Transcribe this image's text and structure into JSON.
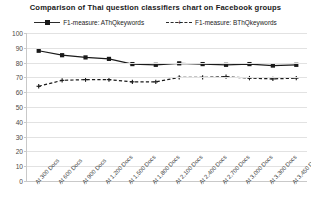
{
  "chart_data": {
    "type": "line",
    "title": "Comparison of Thai question classifiers  chart on Facebook groups",
    "xlabel": "",
    "ylabel": "",
    "ylim": [
      0,
      100
    ],
    "ytick_step": 10,
    "yticks": [
      100,
      90,
      80,
      70,
      60,
      50,
      40,
      30,
      20,
      10,
      0
    ],
    "grid": true,
    "legend_position": "top-center",
    "categories": [
      "At 300 Docs",
      "At 600 Docs",
      "At 900 Docs",
      "At 1,200 Docs",
      "At 1,500 Docs",
      "At 1,800 Docs",
      "At 2,100 Docs",
      "At 2,400 Docs",
      "At 2,700 Docs",
      "At 3,000 Docs",
      "At 3,300 Docs",
      "At 3,450 Docs"
    ],
    "series": [
      {
        "name": "F1-measure: AThQkeywords",
        "style": "solid",
        "marker": "square",
        "color": "#1a1a1a",
        "values": [
          88,
          85,
          83.5,
          82.5,
          79,
          78.5,
          79.5,
          79,
          78.5,
          79,
          78,
          78.5
        ]
      },
      {
        "name": "F1-measure: BThQkeywords",
        "style": "dashed",
        "marker": "cross",
        "color": "#1a1a1a",
        "values": [
          64,
          68,
          68.5,
          68.5,
          67,
          67,
          70,
          70,
          70.5,
          69.5,
          69,
          69.5
        ]
      }
    ]
  },
  "legend": {
    "items": [
      {
        "label": "F1-measure: AThQkeywords"
      },
      {
        "label": "F1-measure: BThQkeywords"
      }
    ]
  }
}
